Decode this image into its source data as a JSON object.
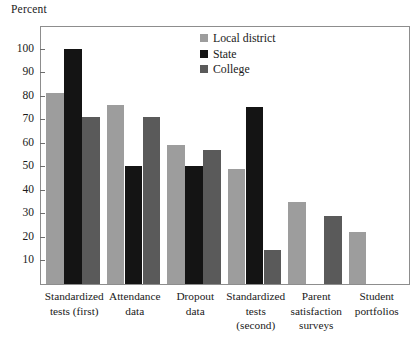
{
  "chart_data": {
    "type": "bar",
    "title": "",
    "subtitle": "",
    "xlabel": "",
    "ylabel": "Percent",
    "ylim": [
      0,
      105
    ],
    "yticks": [
      10,
      20,
      30,
      40,
      50,
      60,
      70,
      80,
      90,
      100
    ],
    "grid": false,
    "legend_position": "top-center",
    "categories": [
      "Standardized tests (first)",
      "Attendance data",
      "Dropout data",
      "Standardized tests (second)",
      "Parent satisfaction surveys",
      "Student portfolios"
    ],
    "category_lines": [
      [
        "Standardized",
        "tests (first)"
      ],
      [
        "Attendance",
        "data"
      ],
      [
        "Dropout",
        "data"
      ],
      [
        "Standardized",
        "tests",
        "(second)"
      ],
      [
        "Parent",
        "satisfaction",
        "surveys"
      ],
      [
        "Student",
        "portfolios"
      ]
    ],
    "series": [
      {
        "name": "Local district",
        "color": "#9d9d9d",
        "values": [
          81,
          76,
          59,
          49,
          35,
          22
        ]
      },
      {
        "name": "State",
        "color": "#141414",
        "values": [
          100,
          50,
          50,
          75,
          null,
          null
        ]
      },
      {
        "name": "College",
        "color": "#5a5a5a",
        "values": [
          71,
          71,
          57,
          14.5,
          29,
          null
        ]
      }
    ]
  },
  "legend": {
    "items": [
      {
        "label": "Local district",
        "color": "#9d9d9d"
      },
      {
        "label": "State",
        "color": "#141414"
      },
      {
        "label": "College",
        "color": "#5a5a5a"
      }
    ]
  },
  "axis": {
    "y_title": "Percent"
  }
}
